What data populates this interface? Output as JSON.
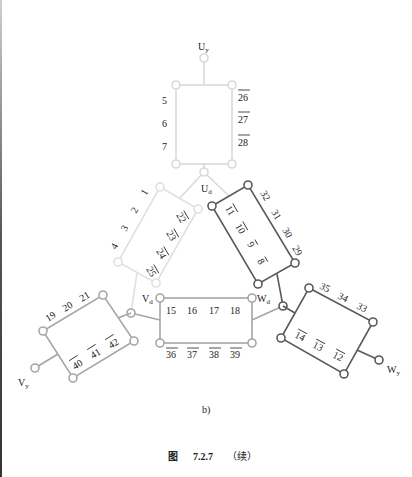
{
  "figure": {
    "sublabel": "b)",
    "caption_prefix": "图",
    "caption_number": "7.2.7",
    "caption_suffix": "（续）"
  },
  "colors": {
    "light": "#d9d9d9",
    "medium": "#a6a6a6",
    "dark": "#595959",
    "text": "#222222"
  },
  "terminals": {
    "Uy": {
      "main": "U",
      "sub": "y"
    },
    "Ud": {
      "main": "U",
      "sub": "d"
    },
    "Vd": {
      "main": "V",
      "sub": "d"
    },
    "Wd": {
      "main": "W",
      "sub": "d"
    },
    "Vy": {
      "main": "V",
      "sub": "y"
    },
    "Wy": {
      "main": "W",
      "sub": "y"
    }
  },
  "coils": {
    "u_top": {
      "left": [
        "5",
        "6",
        "7"
      ],
      "right": [
        "26",
        "27",
        "28"
      ]
    },
    "u_left": {
      "outer": [
        "1",
        "2",
        "3",
        "4"
      ],
      "inner": [
        "22",
        "23",
        "24",
        "25"
      ]
    },
    "w_right": {
      "inner": [
        "11",
        "10",
        "9",
        "8"
      ],
      "outer": [
        "32",
        "31",
        "30",
        "29"
      ]
    },
    "center": {
      "top": [
        "15",
        "16",
        "17",
        "18"
      ],
      "bottom": [
        "36",
        "37",
        "38",
        "39"
      ]
    },
    "v_left": {
      "outer": [
        "19",
        "20",
        "21"
      ],
      "inner": [
        "40",
        "41",
        "42"
      ]
    },
    "w_lower": {
      "outer": [
        "35",
        "34",
        "33"
      ],
      "inner": [
        "14",
        "13",
        "12"
      ]
    }
  }
}
